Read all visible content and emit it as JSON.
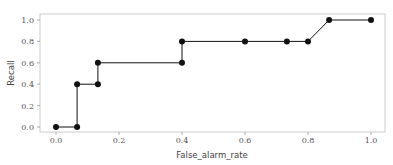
{
  "chart_data": {
    "type": "line",
    "title": "",
    "xlabel": "False_alarm_rate",
    "ylabel": "Recall",
    "xlim": [
      -0.05,
      1.05
    ],
    "ylim": [
      -0.05,
      1.05
    ],
    "grid": false,
    "legend": null,
    "x_ticks": [
      "0.0",
      "0.2",
      "0.4",
      "0.6",
      "0.8",
      "1.0"
    ],
    "y_ticks": [
      "0.0",
      "0.2",
      "0.4",
      "0.6",
      "0.8",
      "1.0"
    ],
    "series": [
      {
        "name": "Recall vs False_alarm_rate",
        "color": "#111111",
        "marker": "circle",
        "x": [
          0.0,
          0.067,
          0.067,
          0.133,
          0.133,
          0.4,
          0.4,
          0.6,
          0.733,
          0.8,
          0.867,
          1.0
        ],
        "y": [
          0.0,
          0.0,
          0.4,
          0.4,
          0.6,
          0.6,
          0.8,
          0.8,
          0.8,
          0.8,
          1.0,
          1.0
        ]
      }
    ]
  }
}
